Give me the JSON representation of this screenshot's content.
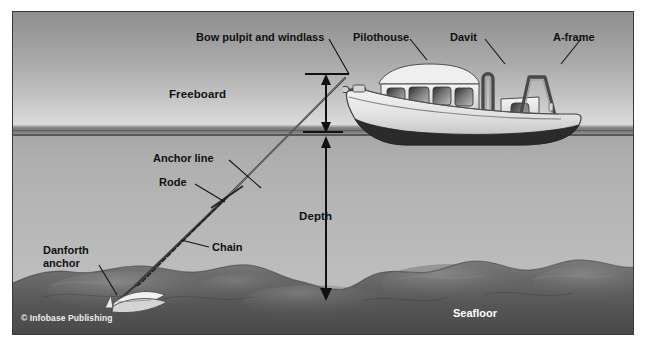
{
  "figure": {
    "kind": "labeled-illustration",
    "credit": "© Infobase Publishing"
  },
  "callouts": {
    "bow_pulpit": "Bow pulpit and windlass",
    "pilothouse": "Pilothouse",
    "davit": "Davit",
    "aframe": "A-frame",
    "anchor_line": "Anchor line",
    "rode": "Rode",
    "chain": "Chain",
    "danforth_line1": "Danforth",
    "danforth_line2": "anchor",
    "seafloor": "Seafloor"
  },
  "measurements": {
    "freeboard": "Freeboard",
    "depth": "Depth"
  },
  "colors": {
    "sky_top": "#8f8f8f",
    "sky_bottom": "#dedede",
    "water": "#b4b4b4",
    "seafloor": "#5f5f5f",
    "hull_below_waterline": "#2f2f2f",
    "hull_above": "#dcdcdc",
    "ink": "#111111",
    "label_white": "#ffffff",
    "frame_border": "#3a3a3a"
  }
}
